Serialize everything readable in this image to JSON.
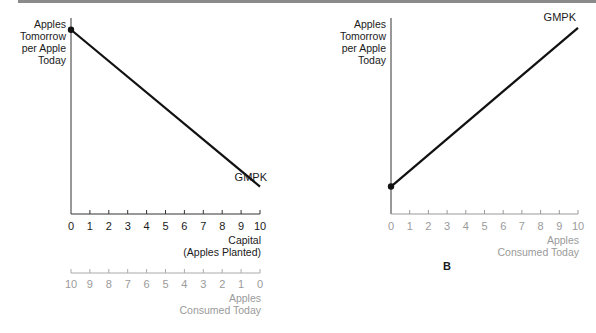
{
  "chart_data": [
    {
      "id": "A",
      "type": "line",
      "panel_label": "",
      "ylabel": "Apples Tomorrow per Apple Today",
      "ylabel_lines": [
        "Apples",
        "Tomorrow",
        "per Apple",
        "Today"
      ],
      "xlabel": "Capital (Apples Planted)",
      "xlabel_lines": [
        "Capital",
        "(Apples Planted)"
      ],
      "x_ticks": [
        "0",
        "1",
        "2",
        "3",
        "4",
        "5",
        "6",
        "7",
        "8",
        "9",
        "10"
      ],
      "secondary_xlabel": "Apples Consumed Today",
      "secondary_xlabel_lines": [
        "Apples",
        "Consumed Today"
      ],
      "secondary_x_ticks": [
        "10",
        "9",
        "8",
        "7",
        "6",
        "5",
        "4",
        "3",
        "2",
        "1",
        "0"
      ],
      "xlim": [
        0,
        10
      ],
      "series": [
        {
          "name": "GMPK",
          "x": [
            0,
            10
          ],
          "y": [
            0.94,
            0.14
          ],
          "marker_at_start": true
        }
      ],
      "annotations": [
        "GMPK"
      ],
      "grid": false,
      "legend": "none"
    },
    {
      "id": "B",
      "type": "line",
      "panel_label": "B",
      "ylabel": "Apples Tomorrow per Apple Today",
      "ylabel_lines": [
        "Apples",
        "Tomorrow",
        "per Apple",
        "Today"
      ],
      "xlabel": "Apples Consumed Today",
      "xlabel_lines": [
        "Apples",
        "Consumed Today"
      ],
      "x_ticks": [
        "0",
        "1",
        "2",
        "3",
        "4",
        "5",
        "6",
        "7",
        "8",
        "9",
        "10"
      ],
      "xlim": [
        0,
        10
      ],
      "series": [
        {
          "name": "GMPK",
          "x": [
            0,
            10
          ],
          "y": [
            0.14,
            0.95
          ],
          "marker_at_start": true
        }
      ],
      "annotations": [
        "GMPK"
      ],
      "grid": false,
      "legend": "none"
    }
  ]
}
